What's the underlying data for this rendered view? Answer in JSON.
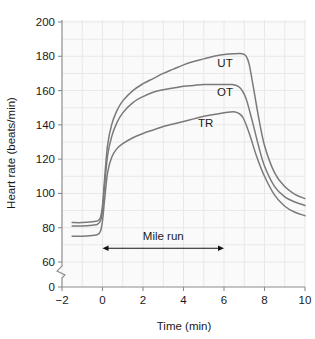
{
  "chart_data": {
    "type": "line",
    "title": "",
    "xlabel": "Time (min)",
    "ylabel": "Heart rate (beats/min)",
    "xlim": [
      -2,
      10
    ],
    "ylim": [
      60,
      200
    ],
    "y_axis_break": true,
    "y_break_from": 0,
    "y_break_to": 60,
    "grid": true,
    "legend_position": "inline-annotation",
    "xticks": [
      -2,
      0,
      2,
      4,
      6,
      8,
      10
    ],
    "xtick_labels": [
      "−2",
      "0",
      "2",
      "4",
      "6",
      "8",
      "10"
    ],
    "yticks": [
      0,
      60,
      80,
      100,
      120,
      140,
      160,
      180,
      200
    ],
    "ytick_labels": [
      "0",
      "60",
      "80",
      "100",
      "120",
      "140",
      "160",
      "180",
      "200"
    ],
    "annotations": [
      {
        "text": "Mile run",
        "type": "double-arrow",
        "x_start": 0,
        "x_end": 6,
        "y": 68
      }
    ],
    "series": [
      {
        "name": "UT",
        "label": "UT",
        "label_x": 6.05,
        "label_y": 174,
        "color": "#7a7a7a",
        "x": [
          -1.5,
          -1.0,
          -0.5,
          -0.25,
          -0.1,
          0.0,
          0.1,
          0.25,
          0.45,
          0.7,
          1.0,
          1.5,
          2.0,
          2.5,
          3.0,
          3.5,
          4.0,
          4.5,
          5.0,
          5.5,
          6.0,
          6.5,
          6.9,
          7.1,
          7.25,
          7.45,
          7.7,
          8.0,
          8.5,
          9.0,
          9.5,
          10.0
        ],
        "y": [
          83,
          83,
          83.5,
          84,
          86,
          93,
          108,
          128,
          140,
          148,
          154,
          160,
          164,
          167,
          170,
          172.5,
          175,
          177,
          178.5,
          180,
          181,
          181.5,
          181.5,
          180,
          175,
          162,
          145,
          128,
          112,
          104,
          99.5,
          97
        ]
      },
      {
        "name": "OT",
        "label": "OT",
        "label_x": 6.05,
        "label_y": 157,
        "color": "#7a7a7a",
        "x": [
          -1.5,
          -1.0,
          -0.5,
          -0.25,
          -0.1,
          0.0,
          0.1,
          0.25,
          0.45,
          0.7,
          1.0,
          1.5,
          2.0,
          2.5,
          3.0,
          3.5,
          4.0,
          4.5,
          5.0,
          5.5,
          6.0,
          6.4,
          6.7,
          6.9,
          7.1,
          7.4,
          7.7,
          8.0,
          8.5,
          9.0,
          9.5,
          10.0
        ],
        "y": [
          81,
          81,
          81.5,
          82,
          84,
          90,
          104,
          122,
          133,
          141,
          147,
          153,
          156.5,
          159,
          160.5,
          161.5,
          162.5,
          163,
          163.5,
          163.5,
          163.5,
          163.5,
          162.5,
          160,
          155,
          142,
          128,
          116,
          104,
          98,
          95,
          93
        ]
      },
      {
        "name": "TR",
        "label": "TR",
        "label_x": 5.1,
        "label_y": 139,
        "color": "#7a7a7a",
        "x": [
          -1.5,
          -1.0,
          -0.5,
          -0.25,
          -0.1,
          0.0,
          0.1,
          0.25,
          0.45,
          0.7,
          1.0,
          1.5,
          2.0,
          2.5,
          3.0,
          3.5,
          4.0,
          4.5,
          5.0,
          5.5,
          6.0,
          6.3,
          6.55,
          6.75,
          6.95,
          7.25,
          7.6,
          8.0,
          8.5,
          9.0,
          9.5,
          10.0
        ],
        "y": [
          75,
          75,
          75.5,
          76,
          78,
          84,
          96,
          112,
          121,
          126,
          129,
          132.5,
          135,
          137,
          139,
          140.5,
          142,
          143.5,
          145,
          146,
          147,
          147.5,
          147.5,
          146.5,
          144,
          135,
          122,
          110,
          99,
          92.5,
          89,
          87
        ]
      }
    ]
  },
  "figure": {
    "background_color": "#ffffff",
    "plot_background_color": "#fafafa",
    "grid_color": "#e8e8e8",
    "axis_color": "#8c8c8c",
    "curve_color": "#7a7a7a",
    "text_color": "#1a1a1a"
  }
}
